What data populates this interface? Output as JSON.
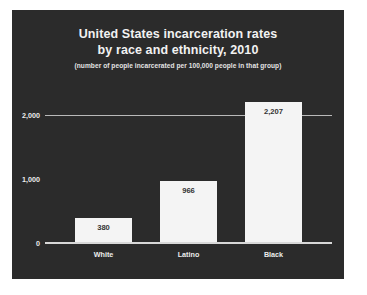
{
  "chart_data": {
    "type": "bar",
    "title": "United States incarceration rates by race and ethnicity, 2010",
    "title_lines": [
      "United States incarceration rates",
      "by race and ethnicity, 2010"
    ],
    "subtitle": "(number of people incarcerated per 100,000 people in that group)",
    "categories": [
      "White",
      "Latino",
      "Black"
    ],
    "values": [
      380,
      966,
      2207
    ],
    "value_labels": [
      "380",
      "966",
      "2,207"
    ],
    "xlabel": "",
    "ylabel": "",
    "ylim": [
      0,
      2400
    ],
    "yticks": [
      0,
      1000,
      2000
    ],
    "ytick_labels": [
      "0",
      "1,000",
      "2,000"
    ],
    "grid": true,
    "gridlines_at": [
      2000
    ],
    "legend": null,
    "colors": {
      "panel_background": "#2b2b2b",
      "page_background": "#ffffff",
      "bar_fill": "#f4f4f4",
      "title_text": "#f2f2f2",
      "subtitle_text": "#e3e3e3",
      "axis_text": "#ededed",
      "gridline": "#b9b9b9",
      "baseline": "#d8d8d8",
      "value_label_text": "#333333"
    }
  }
}
